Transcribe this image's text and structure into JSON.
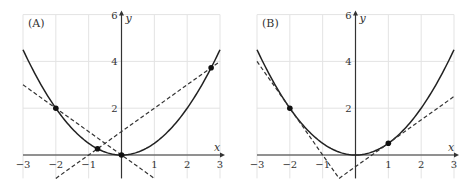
{
  "chart_data": [
    {
      "type": "line",
      "title": "(A)",
      "xlabel": "x",
      "ylabel": "y",
      "xlim": [
        -3,
        3
      ],
      "ylim": [
        -1,
        6
      ],
      "xticks": [
        "-3",
        "-2",
        "-1",
        "1",
        "2",
        "3"
      ],
      "yticks": [
        "2",
        "4",
        "6"
      ],
      "grid": true,
      "series": [
        {
          "name": "y = x^2/2",
          "style": "solid",
          "x": [
            -3,
            -2,
            -1,
            0,
            1,
            2,
            3
          ],
          "values": [
            4.5,
            2,
            0.5,
            0,
            0.5,
            2,
            4.5
          ]
        },
        {
          "name": "y = -x",
          "style": "dashed",
          "x": [
            -3,
            1
          ],
          "values": [
            3,
            -1
          ]
        },
        {
          "name": "y = x + 1",
          "style": "dashed",
          "x": [
            -2,
            3
          ],
          "values": [
            -1,
            4
          ]
        }
      ],
      "points": [
        {
          "x": -2,
          "y": 2
        },
        {
          "x": -0.73,
          "y": 0.27
        },
        {
          "x": 0,
          "y": 0
        },
        {
          "x": 2.73,
          "y": 3.73
        }
      ]
    },
    {
      "type": "line",
      "title": "(B)",
      "xlabel": "x",
      "ylabel": "y",
      "xlim": [
        -3,
        3
      ],
      "ylim": [
        -1,
        6
      ],
      "xticks": [
        "-3",
        "-2",
        "-1",
        "1",
        "2",
        "3"
      ],
      "yticks": [
        "2",
        "4",
        "6"
      ],
      "grid": true,
      "series": [
        {
          "name": "y = x^2/2",
          "style": "solid",
          "x": [
            -3,
            -2,
            -1,
            0,
            1,
            2,
            3
          ],
          "values": [
            4.5,
            2,
            0.5,
            0,
            0.5,
            2,
            4.5
          ]
        },
        {
          "name": "tangent at x=-2: y = -2x - 2",
          "style": "dashed",
          "x": [
            -3,
            -0.5
          ],
          "values": [
            4,
            -1
          ]
        },
        {
          "name": "tangent at x=1: y = x - 0.5",
          "style": "dashed",
          "x": [
            -0.5,
            3
          ],
          "values": [
            -1,
            2.5
          ]
        }
      ],
      "points": [
        {
          "x": -2,
          "y": 2
        },
        {
          "x": 1,
          "y": 0.5
        }
      ]
    }
  ]
}
